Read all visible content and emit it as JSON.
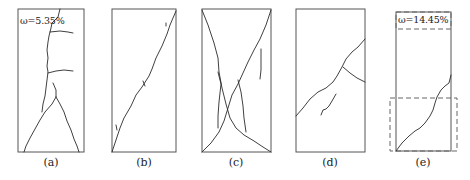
{
  "figure": {
    "panels": [
      {
        "id": "a",
        "caption": "(a)",
        "annotation": "ω=5.35%"
      },
      {
        "id": "b",
        "caption": "(b)"
      },
      {
        "id": "c",
        "caption": "(c)"
      },
      {
        "id": "d",
        "caption": "(d)"
      },
      {
        "id": "e",
        "caption": "(e)",
        "annotation": "ω=14.45%"
      }
    ]
  }
}
